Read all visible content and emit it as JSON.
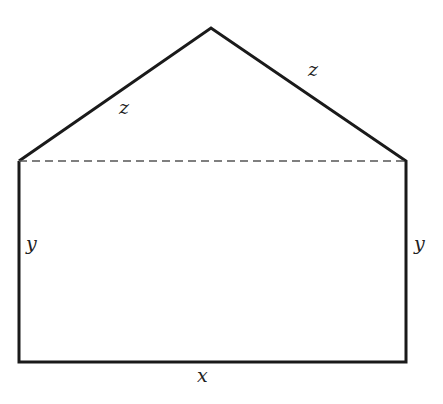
{
  "diagram": {
    "labels": {
      "roof_left": "z",
      "roof_right": "z",
      "wall_left": "y",
      "wall_right": "y",
      "base": "x"
    },
    "colors": {
      "stroke": "#1a1a1a",
      "dashed": "#555555",
      "background": "#ffffff"
    }
  }
}
